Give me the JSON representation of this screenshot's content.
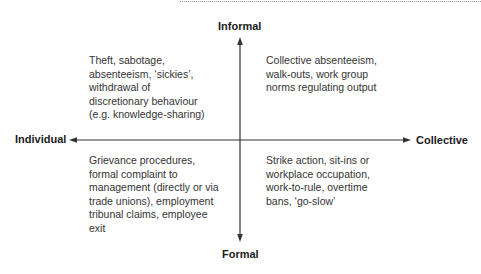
{
  "diagram": {
    "axes": {
      "vertical": {
        "top_label": "Informal",
        "bottom_label": "Formal"
      },
      "horizontal": {
        "left_label": "Individual",
        "right_label": "Collective"
      }
    },
    "quadrants": {
      "top_left": {
        "text": "Theft, sabotage,\nabsenteeism, ‘sickies’,\nwithdrawal of\ndiscretionary behaviour\n(e.g. knowledge-sharing)"
      },
      "top_right": {
        "text": "Collective absenteeism,\nwalk-outs, work group\nnorms regulating output"
      },
      "bottom_left": {
        "text": "Grievance procedures,\nformal complaint to\nmanagement (directly or via\ntrade unions), employment\ntribunal claims, employee\nexit"
      },
      "bottom_right": {
        "text": "Strike action, sit-ins or\nworkplace occupation,\nwork-to-rule, overtime\nbans, ‘go-slow’"
      }
    },
    "colors": {
      "axis_line": "#333333",
      "text": "#333333",
      "background": "#ffffff"
    }
  }
}
